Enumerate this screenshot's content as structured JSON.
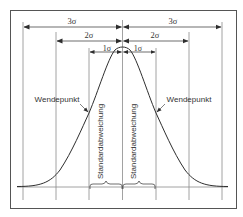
{
  "diagram": {
    "colors": {
      "line": "#7a7a7a",
      "curve": "#2e2e2e",
      "text": "#333333",
      "frame": "#555555",
      "background": "#ffffff"
    },
    "sigma_labels": {
      "left_3": "3σ",
      "right_3": "3σ",
      "left_2": "2σ",
      "right_2": "2σ",
      "left_1": "1σ",
      "right_1": "1σ"
    },
    "inflection_labels": {
      "left": "Wendepunkt",
      "right": "Wendepunkt"
    },
    "std_dev_labels": {
      "left": "Standardabweichung",
      "right": "Standardabweichung"
    }
  }
}
